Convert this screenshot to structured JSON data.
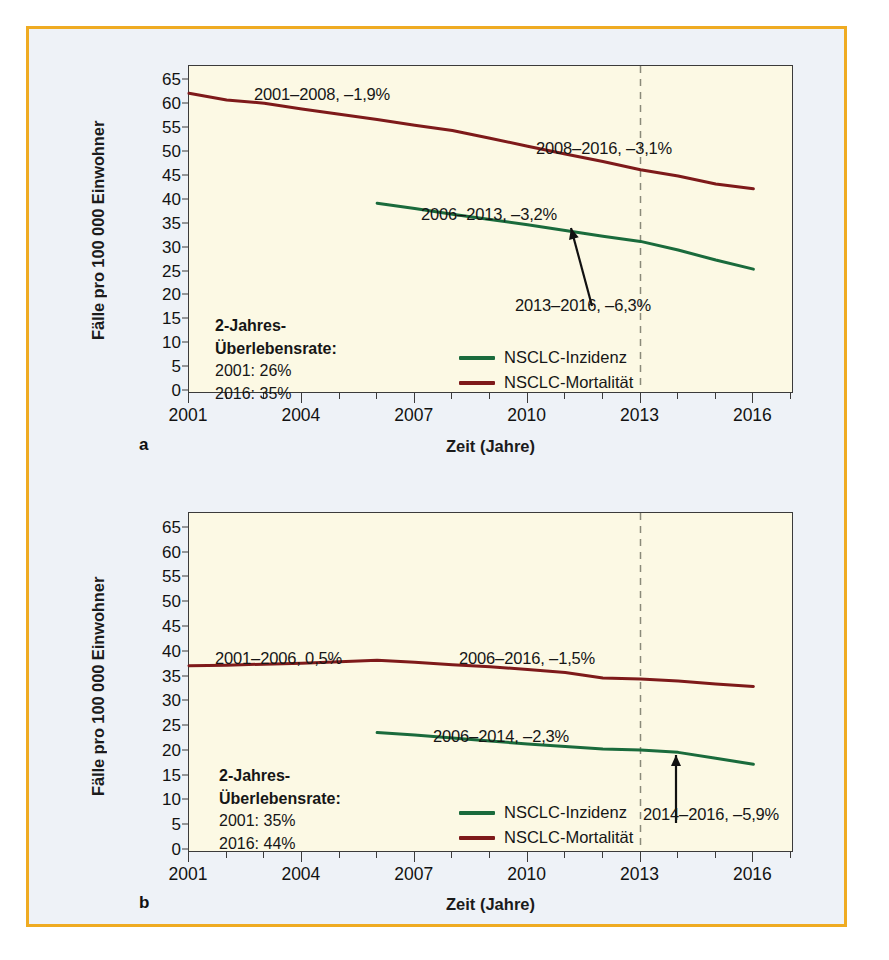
{
  "figure": {
    "border_color": "#efab22",
    "background_color": "#eef2f7",
    "plot_background": "#fcf9e4",
    "incidence_color": "#1a6b3c",
    "mortality_color": "#7e1a1a"
  },
  "panels": [
    {
      "letter": "a",
      "ylabel": "Fälle pro 100 000 Einwohner",
      "xlabel": "Zeit (Jahre)",
      "yticks": [
        0,
        5,
        10,
        15,
        20,
        25,
        30,
        35,
        40,
        45,
        50,
        55,
        60,
        65
      ],
      "xticks": [
        2001,
        2004,
        2007,
        2010,
        2013,
        2016
      ],
      "annotations": [
        "2001–2008, –1,9%",
        "2008–2016, –3,1%",
        "2006–2013, –3,2%",
        "2013–2016, –6,3%"
      ],
      "survival": {
        "heading_line1": "2-Jahres-",
        "heading_line2": "Überlebensrate:",
        "row1": "2001: 26%",
        "row2": "2016: 35%"
      },
      "legend": [
        {
          "label": "NSCLC-Inzidenz",
          "color": "#1a6b3c"
        },
        {
          "label": "NSCLC-Mortalität",
          "color": "#7e1a1a"
        }
      ],
      "marker_year": 2013
    },
    {
      "letter": "b",
      "ylabel": "Fälle pro 100 000 Einwohner",
      "xlabel": "Zeit (Jahre)",
      "yticks": [
        0,
        5,
        10,
        15,
        20,
        25,
        30,
        35,
        40,
        45,
        50,
        55,
        60,
        65
      ],
      "xticks": [
        2001,
        2004,
        2007,
        2010,
        2013,
        2016
      ],
      "annotations": [
        "2001–2006, 0,5%",
        "2006–2016, –1,5%",
        "2006–2014, –2,3%",
        "2014–2016, –5,9%"
      ],
      "survival": {
        "heading_line1": "2-Jahres-",
        "heading_line2": "Überlebensrate:",
        "row1": "2001: 35%",
        "row2": "2016: 44%"
      },
      "legend": [
        {
          "label": "NSCLC-Inzidenz",
          "color": "#1a6b3c"
        },
        {
          "label": "NSCLC-Mortalität",
          "color": "#7e1a1a"
        }
      ],
      "marker_year": 2013
    }
  ],
  "chart_data": [
    {
      "type": "line",
      "panel": "a",
      "title": "NSCLC Inzidenz und Mortalität – Männer",
      "xlabel": "Zeit (Jahre)",
      "ylabel": "Fälle pro 100 000 Einwohner",
      "xlim": [
        2001,
        2017
      ],
      "ylim": [
        0,
        68
      ],
      "ytick_step": 5,
      "xticks": [
        2001,
        2004,
        2007,
        2010,
        2013,
        2016
      ],
      "grid": false,
      "legend_position": "inside-bottom-center",
      "vertical_marker_year": 2013,
      "series": [
        {
          "name": "NSCLC-Mortalität",
          "color": "#7e1a1a",
          "x": [
            2001,
            2002,
            2003,
            2004,
            2005,
            2006,
            2007,
            2008,
            2009,
            2010,
            2011,
            2012,
            2013,
            2014,
            2015,
            2016
          ],
          "values": [
            62.3,
            60.9,
            60.2,
            59.0,
            57.9,
            56.8,
            55.6,
            54.5,
            52.9,
            51.2,
            49.6,
            48.0,
            46.3,
            45.0,
            43.3,
            42.3
          ]
        },
        {
          "name": "NSCLC-Inzidenz",
          "color": "#1a6b3c",
          "x": [
            2006,
            2007,
            2008,
            2009,
            2010,
            2011,
            2012,
            2013,
            2014,
            2015,
            2016
          ],
          "values": [
            39.3,
            38.2,
            37.0,
            35.9,
            34.8,
            33.6,
            32.4,
            31.3,
            29.5,
            27.4,
            25.5
          ]
        }
      ],
      "annotations": [
        {
          "text": "2001–2008, –1,9%",
          "series": "NSCLC-Mortalität",
          "period": "2001-2008",
          "apc": -1.9
        },
        {
          "text": "2008–2016, –3,1%",
          "series": "NSCLC-Mortalität",
          "period": "2008-2016",
          "apc": -3.1
        },
        {
          "text": "2006–2013, –3,2%",
          "series": "NSCLC-Inzidenz",
          "period": "2006-2013",
          "apc": -3.2
        },
        {
          "text": "2013–2016, –6,3%",
          "series": "NSCLC-Inzidenz",
          "period": "2013-2016",
          "apc": -6.3
        }
      ],
      "survival_note": {
        "label": "2-Jahres-Überlebensrate:",
        "2001": "26%",
        "2016": "35%"
      }
    },
    {
      "type": "line",
      "panel": "b",
      "title": "NSCLC Inzidenz und Mortalität – Frauen",
      "xlabel": "Zeit (Jahre)",
      "ylabel": "Fälle pro 100 000 Einwohner",
      "xlim": [
        2001,
        2017
      ],
      "ylim": [
        0,
        68
      ],
      "ytick_step": 5,
      "xticks": [
        2001,
        2004,
        2007,
        2010,
        2013,
        2016
      ],
      "grid": false,
      "legend_position": "inside-bottom-center",
      "vertical_marker_year": 2013,
      "series": [
        {
          "name": "NSCLC-Mortalität",
          "color": "#7e1a1a",
          "x": [
            2001,
            2002,
            2003,
            2004,
            2005,
            2006,
            2007,
            2008,
            2009,
            2010,
            2011,
            2012,
            2013,
            2014,
            2015,
            2016
          ],
          "values": [
            37.2,
            37.3,
            37.5,
            37.7,
            38.0,
            38.3,
            37.9,
            37.4,
            37.0,
            36.4,
            35.8,
            34.7,
            34.5,
            34.1,
            33.5,
            33.0
          ]
        },
        {
          "name": "NSCLC-Inzidenz",
          "color": "#1a6b3c",
          "x": [
            2006,
            2007,
            2008,
            2009,
            2010,
            2011,
            2012,
            2013,
            2014,
            2015,
            2016
          ],
          "values": [
            23.7,
            23.2,
            22.6,
            22.0,
            21.4,
            20.9,
            20.4,
            20.2,
            19.7,
            18.5,
            17.3
          ]
        }
      ],
      "annotations": [
        {
          "text": "2001–2006, 0,5%",
          "series": "NSCLC-Mortalität",
          "period": "2001-2006",
          "apc": 0.5
        },
        {
          "text": "2006–2016, –1,5%",
          "series": "NSCLC-Mortalität",
          "period": "2006-2016",
          "apc": -1.5
        },
        {
          "text": "2006–2014, –2,3%",
          "series": "NSCLC-Inzidenz",
          "period": "2006-2014",
          "apc": -2.3
        },
        {
          "text": "2014–2016, –5,9%",
          "series": "NSCLC-Inzidenz",
          "period": "2014-2016",
          "apc": -5.9
        }
      ],
      "survival_note": {
        "label": "2-Jahres-Überlebensrate:",
        "2001": "35%",
        "2016": "44%"
      }
    }
  ]
}
